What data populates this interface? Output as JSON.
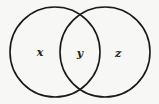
{
  "diagram": {
    "type": "venn",
    "stroke_color": "#1a1a1a",
    "background": "#f7f7f5",
    "circles": [
      {
        "name": "left-circle",
        "cx": 55,
        "cy": 52,
        "r": 45
      },
      {
        "name": "right-circle",
        "cx": 105,
        "cy": 52,
        "r": 45
      }
    ],
    "regions": [
      {
        "name": "left-only",
        "label": "x",
        "x": 40,
        "y": 56
      },
      {
        "name": "intersection",
        "label": "y",
        "x": 80,
        "y": 57
      },
      {
        "name": "right-only",
        "label": "z",
        "x": 118,
        "y": 57
      }
    ]
  }
}
